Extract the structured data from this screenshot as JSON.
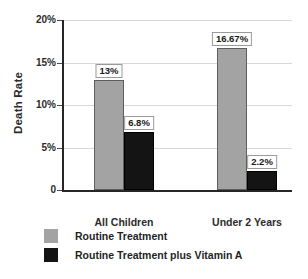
{
  "chart_data": {
    "type": "bar",
    "title": "",
    "xlabel": "",
    "ylabel": "Death Rate",
    "categories": [
      "All Children",
      "Under 2 Years"
    ],
    "ylim": [
      0,
      20
    ],
    "ytick_values": [
      0,
      5,
      10,
      15,
      20
    ],
    "ytick_labels": [
      "0",
      "5%",
      "10%",
      "15%",
      "20%"
    ],
    "grid": true,
    "legend_position": "bottom-left",
    "series": [
      {
        "name": "Routine Treatment",
        "color": "#a3a3a3",
        "values": [
          13,
          16.67
        ],
        "data_labels": [
          "13%",
          "16.67%"
        ]
      },
      {
        "name": "Routine Treatment plus Vitamin A",
        "color": "#141414",
        "values": [
          6.8,
          2.2
        ],
        "data_labels": [
          "6.8%",
          "2.2%"
        ]
      }
    ]
  },
  "axis": {
    "y_title": "Death Rate"
  },
  "legend": {
    "items": [
      {
        "label": "Routine Treatment",
        "swatch": "gray"
      },
      {
        "label": "Routine Treatment plus Vitamin A",
        "swatch": "dark"
      }
    ]
  }
}
